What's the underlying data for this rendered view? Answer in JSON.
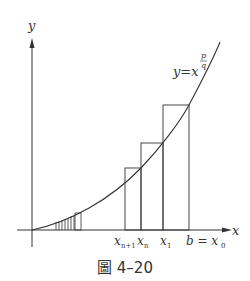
{
  "figure": {
    "axis_x_label": "x",
    "axis_y_label": "y",
    "curve_label_base": "y=x",
    "curve_label_exp_num": "p",
    "curve_label_exp_den": "q",
    "tick_labels": {
      "xn1_base": "x",
      "xn1_sub": "n+1",
      "xn_base": "x",
      "xn_sub": "n",
      "x1_base": "x",
      "x1_sub": "1",
      "b_label": "b = x",
      "b_sub": "0"
    },
    "caption": "圖 4–20",
    "colors": {
      "line": "#333333"
    }
  }
}
